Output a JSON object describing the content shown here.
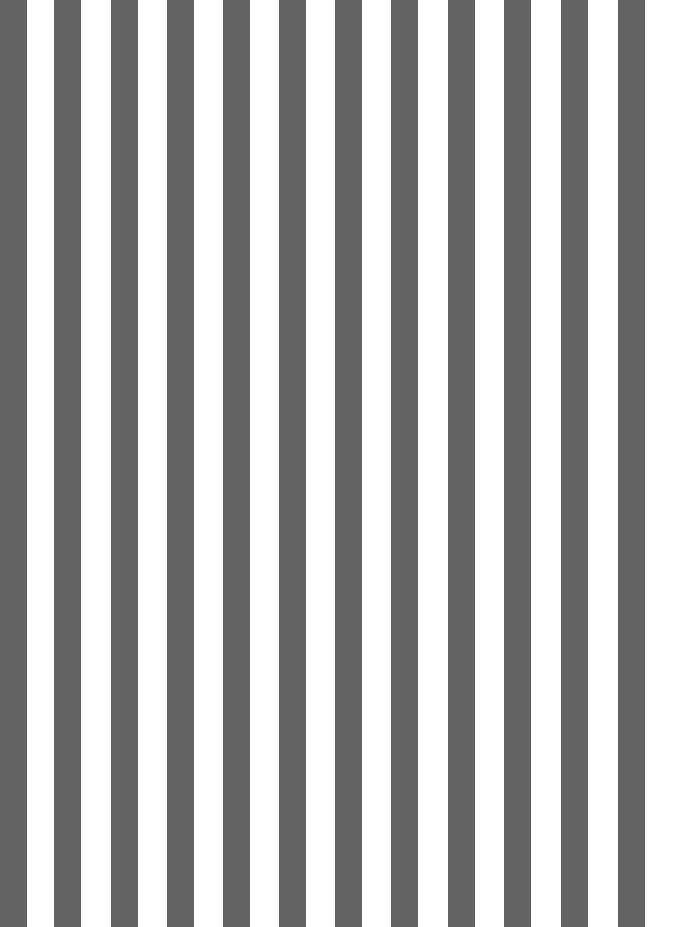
{
  "pattern": {
    "type": "vertical-stripes",
    "stripe_color": "#636363",
    "background_color": "#ffffff",
    "stripe_count": 12,
    "stripe_width": 27,
    "stripes_x": [
      0,
      54,
      111,
      167,
      223,
      279,
      335,
      391,
      448,
      504,
      561,
      618
    ]
  }
}
